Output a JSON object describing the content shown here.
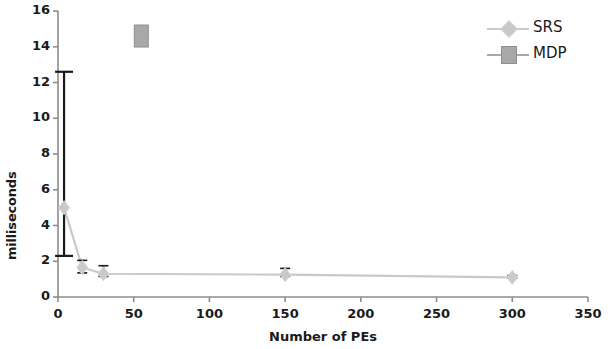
{
  "chart_data": {
    "type": "scatter",
    "title": "",
    "xlabel": "Number of PEs",
    "ylabel": "milliseconds",
    "xlim": [
      0,
      350
    ],
    "ylim": [
      0,
      16
    ],
    "xticks": [
      0,
      50,
      100,
      150,
      200,
      250,
      300,
      350
    ],
    "yticks": [
      0,
      2,
      4,
      6,
      8,
      10,
      12,
      14,
      16
    ],
    "grid": false,
    "legend_position": "top-right",
    "series": [
      {
        "name": "SRS",
        "marker": "diamond",
        "color": "#c9c9c9",
        "line": true,
        "points": [
          {
            "x": 4,
            "y": 5.0,
            "yerr_low": 2.3,
            "yerr_high": 12.6
          },
          {
            "x": 16,
            "y": 1.65,
            "yerr_low": 1.35,
            "yerr_high": 2.05
          },
          {
            "x": 30,
            "y": 1.3,
            "yerr_low": 1.15,
            "yerr_high": 1.75
          },
          {
            "x": 150,
            "y": 1.25,
            "yerr_low": 1.15,
            "yerr_high": 1.6
          },
          {
            "x": 300,
            "y": 1.1,
            "yerr_low": 1.05,
            "yerr_high": 1.2
          }
        ]
      },
      {
        "name": "MDP",
        "marker": "square",
        "color": "#a8a8a8",
        "line": true,
        "points": [
          {
            "x": 55,
            "y": 14.6,
            "yerr_low": 14.1,
            "yerr_high": 15.05
          }
        ]
      }
    ]
  },
  "legend": {
    "items": [
      {
        "label": "SRS"
      },
      {
        "label": "MDP"
      }
    ]
  },
  "axes": {
    "x_title": "Number of PEs",
    "y_title": "milliseconds",
    "x_tick_labels": [
      "0",
      "50",
      "100",
      "150",
      "200",
      "250",
      "300",
      "350"
    ],
    "y_tick_labels": [
      "0",
      "2",
      "4",
      "6",
      "8",
      "10",
      "12",
      "14",
      "16"
    ]
  },
  "colors": {
    "axis": "#8c8c8c",
    "text": "#1a1a1a",
    "srs": "#c9c9c9",
    "mdp": "#a8a8a8",
    "errorbar": "#1a1a1a"
  }
}
